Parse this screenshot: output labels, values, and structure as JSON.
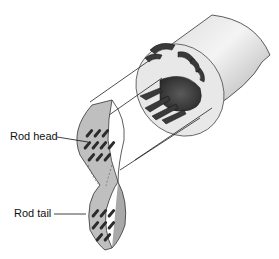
{
  "diagram": {
    "labels": {
      "rod_head": "Rod head",
      "rod_tail": "Rod tail"
    },
    "colors": {
      "cylinder_light": "#e6e6e6",
      "cylinder_shadow": "#c8c8c8",
      "arrow_dark": "#3a3a3a",
      "rod_dark": "#2b2b2b",
      "ribbon_gray": "#b5b5b5",
      "line": "#222222"
    }
  }
}
